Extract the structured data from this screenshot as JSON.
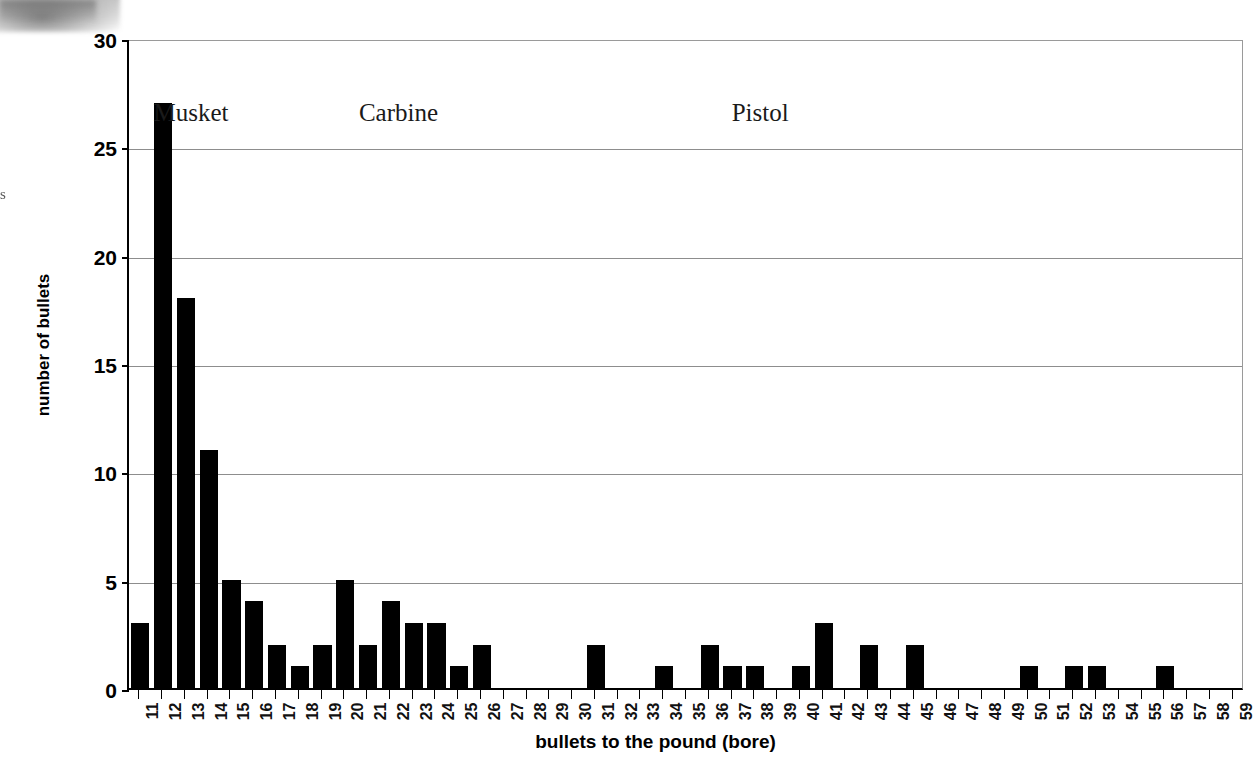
{
  "chart_data": {
    "type": "bar",
    "title": "",
    "xlabel": "bullets to the pound (bore)",
    "ylabel": "number of bullets",
    "xlim": [
      10.5,
      59.5
    ],
    "ylim": [
      0,
      30
    ],
    "yticks": [
      0,
      5,
      10,
      15,
      20,
      25,
      30
    ],
    "grid": true,
    "legend": "none",
    "bar_color": "#000000",
    "categories": [
      "11",
      "12",
      "13",
      "14",
      "15",
      "16",
      "17",
      "18",
      "19",
      "20",
      "21",
      "22",
      "23",
      "24",
      "25",
      "26",
      "27",
      "28",
      "29",
      "30",
      "31",
      "32",
      "33",
      "34",
      "35",
      "36",
      "37",
      "38",
      "39",
      "40",
      "41",
      "42",
      "43",
      "44",
      "45",
      "46",
      "47",
      "48",
      "49",
      "50",
      "51",
      "52",
      "53",
      "54",
      "55",
      "56",
      "57",
      "58",
      "59"
    ],
    "values": [
      3,
      27,
      18,
      11,
      5,
      4,
      2,
      1,
      2,
      5,
      2,
      4,
      3,
      3,
      1,
      2,
      0,
      0,
      0,
      0,
      2,
      0,
      0,
      1,
      0,
      2,
      1,
      1,
      0,
      1,
      3,
      0,
      2,
      0,
      2,
      0,
      0,
      0,
      0,
      1,
      0,
      1,
      1,
      0,
      0,
      1,
      0,
      0,
      0
    ],
    "annotations": [
      {
        "text": "Musket",
        "x_pct": 2.2,
        "y_top": 58
      },
      {
        "text": "Carbine",
        "x_pct": 20.6,
        "y_top": 58
      },
      {
        "text": "Pistol",
        "x_pct": 54.0,
        "y_top": 58
      }
    ]
  },
  "artifacts": {
    "edge_glyph": "s"
  }
}
